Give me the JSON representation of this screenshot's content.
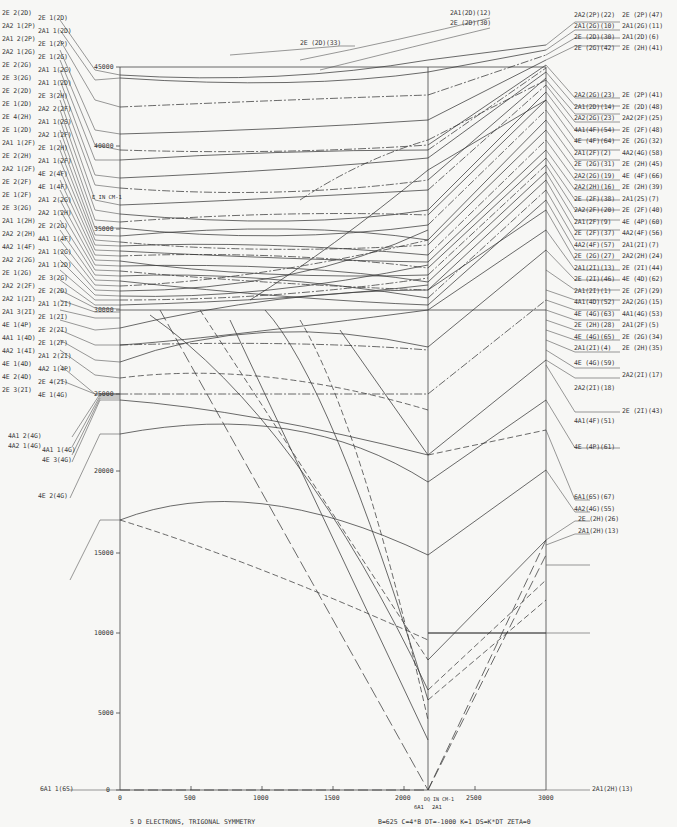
{
  "chart_data": {
    "type": "line",
    "title": "5 D ELECTRONS, TRIGONAL SYMMETRY",
    "parameters": "B=625  C=4*B  DT=-1000  K=1  DS=K*DT  ZETA=0",
    "xlabel": "DQ IN CM-1",
    "ylabel": "E IN CM-1",
    "xlim": [
      0,
      3000
    ],
    "ylim": [
      0,
      45000
    ],
    "x_ticks": [
      "0",
      "500",
      "1000",
      "1500",
      "2000",
      "2500",
      "3000"
    ],
    "y_ticks": [
      "0",
      "5000",
      "10000",
      "15000",
      "20000",
      "25000",
      "30000",
      "35000",
      "40000",
      "45000"
    ],
    "crossover_labels": [
      "6A1",
      "2A1"
    ],
    "crossover_dq": 2150,
    "left_free_ion_terms": [
      "2E 2(2D)",
      "2E 1(2D)",
      "2A2 1(2P)",
      "2A1 1(2D)",
      "2A1 2(2P)",
      "2E 1(2P)",
      "2A2 1(2G)",
      "2E 1(2G)",
      "2E 2(2G)",
      "2A1 1(2G)",
      "2E 3(2G)",
      "2A1 1(2D)",
      "2E 2(2D)",
      "2E 3(2H)",
      "2E 1(2D)",
      "2A2 2(2F)",
      "2E 4(2H)",
      "2A1 1(2S)",
      "2E 1(2D)",
      "2A2 1(2F)",
      "2A1 1(2F)",
      "2E 1(2H)",
      "2E 2(2H)",
      "2A1 1(2F)",
      "2A2 1(2F)",
      "4E 2(4F)",
      "2E 2(2F)",
      "4E 1(4F)",
      "2E 1(2F)",
      "2A1 2(2G)",
      "2E 3(2G)",
      "2A2 1(2H)",
      "2A1 1(2H)",
      "2E 2(2G)",
      "2A2 2(2H)",
      "4A1 1(4F)",
      "4A2 1(4F)",
      "2A1 1(2G)",
      "2A2 2(2G)",
      "2A1 1(2D)",
      "2E 1(2G)",
      "2E 3(2G)",
      "2A2 2(2F)",
      "2E 2(2D)",
      "2A2 1(2I)",
      "2A1 1(2I)",
      "2A1 3(2I)",
      "2E 1(2I)",
      "4E 1(4P)",
      "2E 2(2I)",
      "4A1 1(4D)",
      "2E 1(2F)",
      "4A2 1(4I)",
      "2A1 2(2I)",
      "4E 1(4D)",
      "4A2 1(4P)",
      "4E 2(4D)",
      "2E 4(2I)",
      "2E 3(2I)",
      "4E 1(4G)",
      "4A1 2(4G)",
      "4A2 1(4G)",
      "4A1 1(4G)",
      "4E 3(4G)",
      "4E 2(4G)",
      "6A1 1(6S)"
    ],
    "right_state_labels": [
      "2A1(2D)(12)",
      "2E (2D)(30)",
      "2E (2D)(33)",
      "2A2(2P)(22)",
      "2E (2P)(47)",
      "2A1(2G)(10)",
      "2A1(2G)(11)",
      "2E (2D)(30)",
      "2A1(2D)(6)",
      "2E (2G)(42)",
      "2E (2H)(41)",
      "2A2(2G)(23)",
      "2E (2P)(41)",
      "2A1(2D)(14)",
      "2E (2D)(48)",
      "2A2(2G)(23)",
      "2A2(2F)(25)",
      "4A1(4F)(54)",
      "2E (2F)(48)",
      "4E (4F)(64)",
      "2E (2G)(32)",
      "2A1(2F)(2)",
      "4A2(4G)(58)",
      "2E (2G)(31)",
      "2E (2H)(45)",
      "2A2(2G)(19)",
      "4E (4F)(66)",
      "2A2(2H)(16)",
      "2E (2H)(39)",
      "2E (2F)(38)",
      "2A1(2S)(7)",
      "2A2(2F)(20)",
      "2E (2F)(40)",
      "2A1(2F)(9)",
      "4E (4P)(60)",
      "2E (2F)(37)",
      "4A2(4F)(56)",
      "4A2(4F)(57)",
      "2A1(2I)(7)",
      "2E (2G)(27)",
      "2A2(2H)(24)",
      "2A1(2I)(13)",
      "2E (2I)(44)",
      "2E (2I)(46)",
      "4E (4D)(62)",
      "2A1(2I)(1)",
      "2E (2F)(29)",
      "4A1(4D)(52)",
      "2A2(2G)(15)",
      "4E (4G)(63)",
      "4A1(4G)(53)",
      "2E (2H)(28)",
      "2A1(2F)(5)",
      "4E (4G)(65)",
      "2E (2G)(34)",
      "2A1(2I)(4)",
      "2E (2H)(35)",
      "4E (4G)(59)",
      "2A2(2I)(17)",
      "2A2(2I)(18)",
      "2E (2I)(43)",
      "4A1(4F)(51)",
      "4E (4P)(61)",
      "6A1(6S)(67)",
      "4A2(4G)(55)",
      "2E (2H)(26)",
      "2A1(2H)(13)"
    ],
    "series_samples": [
      {
        "name": "6A1(6S)",
        "style": "dash",
        "x": [
          0,
          2150,
          3000
        ],
        "y": [
          0,
          0,
          16000
        ]
      },
      {
        "name": "2A1 ground beyond crossover",
        "style": "dash",
        "x": [
          0,
          2150,
          3000
        ],
        "y": [
          33000,
          0,
          14000
        ]
      },
      {
        "name": "2E (2H)(26)",
        "style": "solid",
        "x": [
          0,
          2150,
          3000
        ],
        "y": [
          16900,
          10000,
          10000
        ]
      },
      {
        "name": "4A2(4G)(55)",
        "style": "solid",
        "x": [
          0,
          700,
          2150,
          3000
        ],
        "y": [
          16900,
          19000,
          14300,
          21000
        ]
      },
      {
        "name": "4E (4G)",
        "style": "solid",
        "x": [
          0,
          2150,
          3000
        ],
        "y": [
          22000,
          18600,
          29000
        ]
      },
      {
        "name": "4A1 (4G)",
        "style": "dashdot",
        "x": [
          0,
          2150,
          3000
        ],
        "y": [
          24500,
          24500,
          24500
        ]
      }
    ],
    "grid": false,
    "legend": "none (state labels at both ends)"
  },
  "axes": {
    "x_tick_labels": [
      "0",
      "500",
      "1000",
      "1500",
      "2000",
      "2500",
      "3000"
    ],
    "y_tick_labels": [
      "0",
      "5000",
      "10000",
      "15000",
      "20000",
      "25000",
      "30000",
      "35000",
      "40000",
      "45000"
    ],
    "y_axis_title": "E IN CM-1",
    "x_axis_title": "DQ IN CM-1",
    "crossover_left": "6A1",
    "crossover_right": "2A1"
  },
  "footer": {
    "left": "5 D ELECTRONS, TRIGONAL SYMMETRY",
    "right": "B=625   C=4*B   DT=-1000   K=1     DS=K*DT   ZETA=0"
  },
  "top_labels": {
    "a": "2A1(2D)(12)",
    "b": "2E (2D)(30)",
    "c": "2E (2D)(33)"
  },
  "bottom_left_label": "6A1 1(6S)",
  "bottom_right_label": "2A1(2H)(13)"
}
